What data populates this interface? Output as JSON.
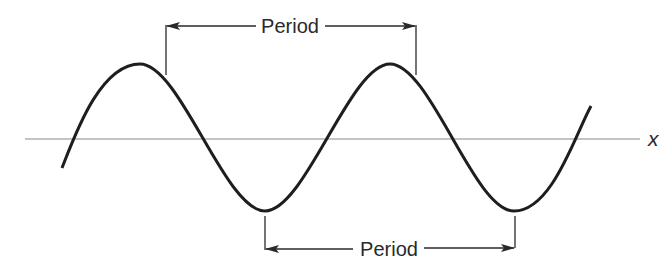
{
  "diagram": {
    "axis_label": "x",
    "top_label": "Period",
    "bottom_label": "Period",
    "colors": {
      "curve": "#1e1e1e",
      "axis": "#8a8a8a",
      "arrow": "#2a2a2a",
      "background": "#ffffff"
    }
  }
}
